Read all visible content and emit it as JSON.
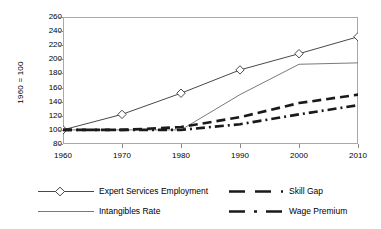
{
  "chart_data": {
    "type": "line",
    "title": "",
    "xlabel": "",
    "ylabel": "1960 = 100",
    "x": [
      1960,
      1970,
      1980,
      1990,
      2000,
      2010
    ],
    "xtick_labels": [
      "1960",
      "1970",
      "1980",
      "1990",
      "2000",
      "2010"
    ],
    "ytick_labels": [
      "260",
      "240",
      "220",
      "200",
      "180",
      "160",
      "140",
      "120",
      "100",
      "80"
    ],
    "ytick_values": [
      260,
      240,
      220,
      200,
      180,
      160,
      140,
      120,
      100,
      80
    ],
    "xlim": [
      1960,
      2010
    ],
    "ylim": [
      80,
      260
    ],
    "grid": false,
    "legend_position": "bottom",
    "series": [
      {
        "name": "Expert Services  Employment",
        "style": "solid-thin-with-diamond-markers",
        "marker": "diamond-open",
        "color": "#333333",
        "values": [
          100,
          122,
          152,
          185,
          208,
          232
        ]
      },
      {
        "name": "Intangibles Rate",
        "style": "solid-thin",
        "marker": "none",
        "color": "#6b6b6b",
        "values": [
          100,
          100,
          100,
          150,
          193,
          195
        ]
      },
      {
        "name": "Skill Gap",
        "style": "long-dash-thick",
        "marker": "none",
        "color": "#1a1a1a",
        "values": [
          100,
          100,
          104,
          118,
          138,
          150
        ]
      },
      {
        "name": "Wage Premium",
        "style": "dash-dot-thick",
        "marker": "none",
        "color": "#1a1a1a",
        "values": [
          100,
          100,
          100,
          108,
          122,
          135
        ]
      }
    ]
  },
  "legend": {
    "items": [
      {
        "label": "Expert Services  Employment"
      },
      {
        "label": "Skill Gap"
      },
      {
        "label": "Intangibles Rate"
      },
      {
        "label": "Wage Premium"
      }
    ]
  }
}
